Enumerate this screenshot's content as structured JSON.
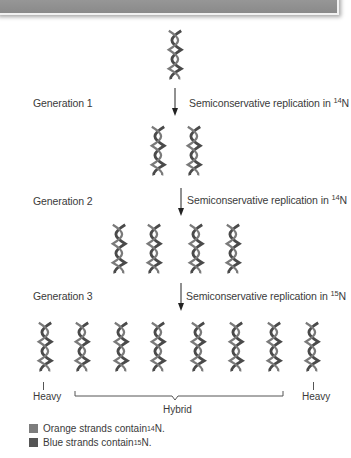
{
  "diagram": {
    "generations": [
      {
        "label": "Generation 1",
        "step": {
          "text": "Semiconservative replication in ",
          "isotope_mass": "14",
          "isotope_symbol": "N"
        },
        "helix_count": 2
      },
      {
        "label": "Generation 2",
        "step": {
          "text": "Semiconservative replication in ",
          "isotope_mass": "14",
          "isotope_symbol": "N"
        },
        "helix_count": 4
      },
      {
        "label": "Generation 3",
        "step": {
          "text": "Semiconservative replication in ",
          "isotope_mass": "15",
          "isotope_symbol": "N"
        },
        "helix_count": 8
      }
    ],
    "initial_helix_count": 1,
    "density_labels": {
      "left": "Heavy",
      "middle": "Hybrid",
      "right": "Heavy"
    }
  },
  "legend": [
    {
      "text": "Orange strands contain ",
      "isotope_mass": "14",
      "isotope_symbol": "N.",
      "color": "#7d7d7d"
    },
    {
      "text": "Blue strands contain ",
      "isotope_mass": "15",
      "isotope_symbol": "N.",
      "color": "#555555"
    }
  ],
  "colors": {
    "helix_stroke": "#555555",
    "topbar": "#929292",
    "text": "#3a3a3a"
  }
}
